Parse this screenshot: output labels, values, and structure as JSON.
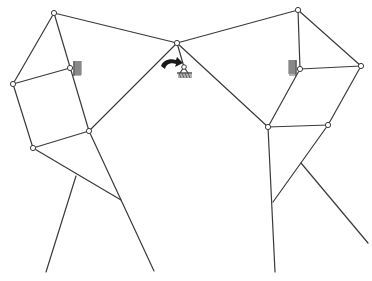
{
  "diagram": {
    "type": "planar-linkage-mechanism",
    "colors": {
      "link": "#3a3a3a",
      "joint_fill": "#ffffff",
      "ground_hatch": "#555555",
      "arrow": "#1a1a1a",
      "background": "#ffffff"
    },
    "joints": [
      {
        "id": "A",
        "x": 54,
        "y": 13
      },
      {
        "id": "B",
        "x": 13,
        "y": 84
      },
      {
        "id": "C",
        "x": 70,
        "y": 68,
        "grounded": true
      },
      {
        "id": "D",
        "x": 89,
        "y": 131
      },
      {
        "id": "E",
        "x": 33,
        "y": 148
      },
      {
        "id": "F",
        "x": 177,
        "y": 43
      },
      {
        "id": "P",
        "x": 184,
        "y": 67,
        "grounded": true
      },
      {
        "id": "G",
        "x": 298,
        "y": 10
      },
      {
        "id": "H",
        "x": 300,
        "y": 69,
        "grounded": true
      },
      {
        "id": "I",
        "x": 361,
        "y": 66
      },
      {
        "id": "J",
        "x": 268,
        "y": 127
      },
      {
        "id": "K",
        "x": 328,
        "y": 125
      }
    ],
    "links": [
      {
        "from": [
          54,
          13
        ],
        "to": [
          177,
          43
        ]
      },
      {
        "from": [
          54,
          13
        ],
        "to": [
          13,
          84
        ]
      },
      {
        "from": [
          54,
          13
        ],
        "to": [
          89,
          131
        ]
      },
      {
        "from": [
          13,
          84
        ],
        "to": [
          70,
          68
        ]
      },
      {
        "from": [
          13,
          84
        ],
        "to": [
          33,
          148
        ]
      },
      {
        "from": [
          33,
          148
        ],
        "to": [
          89,
          131
        ]
      },
      {
        "from": [
          89,
          131
        ],
        "to": [
          177,
          43
        ]
      },
      {
        "from": [
          33,
          148
        ],
        "to": [
          121,
          200
        ]
      },
      {
        "from": [
          89,
          131
        ],
        "to": [
          154,
          271
        ]
      },
      {
        "from": [
          76,
          176
        ],
        "to": [
          46,
          272
        ]
      },
      {
        "from": [
          177,
          43
        ],
        "to": [
          184,
          67
        ]
      },
      {
        "from": [
          177,
          43
        ],
        "to": [
          298,
          10
        ]
      },
      {
        "from": [
          177,
          43
        ],
        "to": [
          268,
          127
        ]
      },
      {
        "from": [
          298,
          10
        ],
        "to": [
          300,
          69
        ]
      },
      {
        "from": [
          298,
          10
        ],
        "to": [
          361,
          66
        ]
      },
      {
        "from": [
          300,
          69
        ],
        "to": [
          361,
          66
        ]
      },
      {
        "from": [
          300,
          69
        ],
        "to": [
          268,
          127
        ]
      },
      {
        "from": [
          361,
          66
        ],
        "to": [
          328,
          125
        ]
      },
      {
        "from": [
          268,
          127
        ],
        "to": [
          328,
          125
        ]
      },
      {
        "from": [
          268,
          127
        ],
        "to": [
          275,
          272
        ]
      },
      {
        "from": [
          328,
          125
        ],
        "to": [
          273,
          202
        ]
      },
      {
        "from": [
          301,
          163
        ],
        "to": [
          368,
          243
        ]
      }
    ],
    "grounds": [
      {
        "id": "ground-left",
        "x": 74,
        "y": 61,
        "orientation": "right"
      },
      {
        "id": "ground-center",
        "x": 177,
        "y": 73,
        "orientation": "down"
      },
      {
        "id": "ground-right",
        "x": 288,
        "y": 60,
        "orientation": "left"
      }
    ],
    "input_arrow": {
      "label": "input-rotation",
      "x": 160,
      "y": 58,
      "direction": "clockwise"
    }
  }
}
